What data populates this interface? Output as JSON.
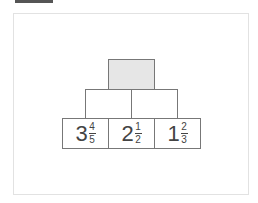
{
  "pyramid": {
    "top": {
      "value": "",
      "shaded": true,
      "fill": "#e6e6e6"
    },
    "middle": [
      {
        "value": ""
      },
      {
        "value": ""
      }
    ],
    "bottom": [
      {
        "whole": "3",
        "numerator": "4",
        "denominator": "5"
      },
      {
        "whole": "2",
        "numerator": "1",
        "denominator": "2"
      },
      {
        "whole": "1",
        "numerator": "2",
        "denominator": "3"
      }
    ]
  }
}
